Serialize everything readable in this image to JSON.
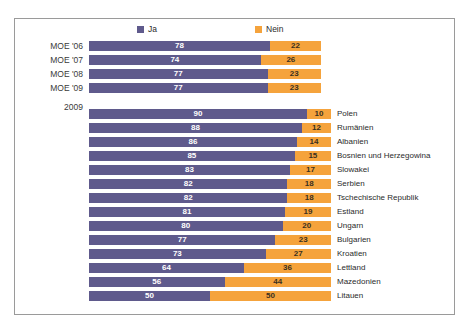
{
  "chart_data": {
    "type": "bar",
    "orientation": "horizontal",
    "stacked": true,
    "stacked_total": 100,
    "title": "",
    "xlabel": "",
    "ylabel": "",
    "xlim": [
      0,
      100
    ],
    "grid": false,
    "legend_position": "top",
    "legend": [
      {
        "name": "Ja",
        "color": "#5f5a8c"
      },
      {
        "name": "Nein",
        "color": "#f5a33c"
      }
    ],
    "series": [
      {
        "name": "Ja",
        "color": "#5f5a8c"
      },
      {
        "name": "Nein",
        "color": "#f5a33c"
      }
    ],
    "groups": [
      {
        "id": "moe-trend",
        "heading": "",
        "categories": [
          "MOE '06",
          "MOE '07",
          "MOE '08",
          "MOE '09"
        ],
        "rows": [
          {
            "label": "MOE '06",
            "ja": 78,
            "nein": 22
          },
          {
            "label": "MOE '07",
            "ja": 74,
            "nein": 26
          },
          {
            "label": "MOE '08",
            "ja": 77,
            "nein": 23
          },
          {
            "label": "MOE '09",
            "ja": 77,
            "nein": 23
          }
        ]
      },
      {
        "id": "countries-2009",
        "heading": "2009",
        "categories": [
          "Polen",
          "Rumänien",
          "Albanien",
          "Bosnien und Herzegowina",
          "Slowakei",
          "Serbien",
          "Tschechische Republik",
          "Estland",
          "Ungarn",
          "Bulgarien",
          "Kroatien",
          "Lettland",
          "Mazedonien",
          "Litauen"
        ],
        "rows": [
          {
            "label": "Polen",
            "ja": 90,
            "nein": 10
          },
          {
            "label": "Rumänien",
            "ja": 88,
            "nein": 12
          },
          {
            "label": "Albanien",
            "ja": 86,
            "nein": 14
          },
          {
            "label": "Bosnien und Herzegowina",
            "ja": 85,
            "nein": 15
          },
          {
            "label": "Slowakei",
            "ja": 83,
            "nein": 17
          },
          {
            "label": "Serbien",
            "ja": 82,
            "nein": 18
          },
          {
            "label": "Tschechische Republik",
            "ja": 82,
            "nein": 18
          },
          {
            "label": "Estland",
            "ja": 81,
            "nein": 19
          },
          {
            "label": "Ungarn",
            "ja": 80,
            "nein": 20
          },
          {
            "label": "Bulgarien",
            "ja": 77,
            "nein": 23
          },
          {
            "label": "Kroatien",
            "ja": 73,
            "nein": 27
          },
          {
            "label": "Lettland",
            "ja": 64,
            "nein": 36
          },
          {
            "label": "Mazedonien",
            "ja": 56,
            "nein": 44
          },
          {
            "label": "Litauen",
            "ja": 50,
            "nein": 50
          }
        ]
      }
    ]
  },
  "legend": {
    "ja_label": "Ja",
    "nein_label": "Nein"
  },
  "year_marker": "2009",
  "colors": {
    "ja": "#5f5a8c",
    "nein": "#f5a33c",
    "frame": "#9a9a9a",
    "background": "#ffffff"
  }
}
